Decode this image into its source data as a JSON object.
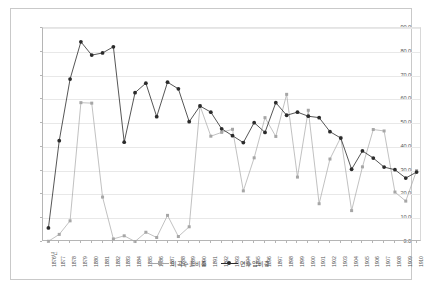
{
  "chart_data": {
    "type": "line",
    "title": "",
    "xlabel": "",
    "ylabel": "",
    "ylim": [
      0,
      90
    ],
    "ytick_step": 10,
    "ytick_labels": [
      "0.0",
      "10.0",
      "20.0",
      "30.0",
      "40.0",
      "50.0",
      "60.0",
      "70.0",
      "80.0",
      "90.0"
    ],
    "grid": true,
    "legend_position": "bottom",
    "categories": [
      "1876년",
      "1877",
      "1878",
      "1879",
      "1880",
      "1881",
      "1882",
      "1883",
      "1884",
      "1885",
      "1886",
      "1887",
      "1888",
      "1889",
      "1890",
      "1891",
      "1892",
      "1893",
      "1894",
      "1895",
      "1896",
      "1897",
      "1898",
      "1899",
      "1900",
      "1901",
      "1902",
      "1903",
      "1904",
      "1905",
      "1906",
      "1907",
      "1908",
      "1909",
      "1910"
    ],
    "series": [
      {
        "name": "미곡수출비중",
        "color": "#a6a6a6",
        "marker": "square",
        "values": [
          0.3,
          3.2,
          8.9,
          58.6,
          58.4,
          18.9,
          1.3,
          2.6,
          0.2,
          4.1,
          1.9,
          11.2,
          2.3,
          6.4,
          57.3,
          44.5,
          46.1,
          47.4,
          21.5,
          35.4,
          52.3,
          44.4,
          62.1,
          27.3,
          55.4,
          16.1,
          34.9,
          44.0,
          13.2,
          31.6,
          47.3,
          46.7,
          21.0,
          17.2,
          30.0
        ]
      },
      {
        "name": "면수입비중",
        "color": "#2b2b2b",
        "marker": "circle",
        "values": [
          5.9,
          42.6,
          68.5,
          84.2,
          78.6,
          79.5,
          82.1,
          42.0,
          62.8,
          66.8,
          52.7,
          67.2,
          64.4,
          50.6,
          57.2,
          54.6,
          47.6,
          44.7,
          41.8,
          50.2,
          46.1,
          58.6,
          53.3,
          54.6,
          52.9,
          52.3,
          46.4,
          43.7,
          30.6,
          38.3,
          35.3,
          31.5,
          30.4,
          26.9,
          29.4
        ]
      }
    ]
  },
  "legend": {
    "items": [
      {
        "label": "미곡수출비중"
      },
      {
        "label": "면수입비중"
      }
    ]
  }
}
